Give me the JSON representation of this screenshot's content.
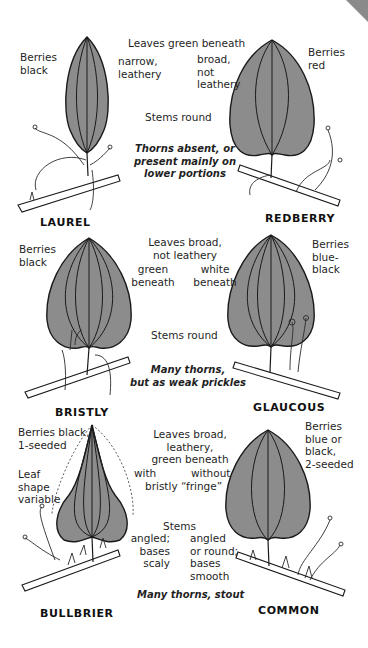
{
  "page": {
    "colors": {
      "leaf_fill": "#8c8c8c",
      "line": "#1a1a1a",
      "background": "#ffffff",
      "corner_tab": "#8a8a8a"
    }
  },
  "rows": [
    {
      "left": {
        "species": "LAUREL",
        "berries": "Berries\nblack"
      },
      "right": {
        "species": "REDBERRY",
        "berries": "Berries\nred"
      },
      "center": {
        "leaves_heading": "Leaves green beneath",
        "leaves_left": "narrow,\nleathery",
        "leaves_right": "broad,\nnot\nleathery",
        "stems": "Stems round",
        "thorns": "Thorns absent, or\npresent mainly on\nlower portions"
      }
    },
    {
      "left": {
        "species": "BRISTLY",
        "berries": "Berries\nblack"
      },
      "right": {
        "species": "GLAUCOUS",
        "berries": "Berries\nblue-\nblack"
      },
      "center": {
        "leaves_heading": "Leaves broad,\nnot leathery",
        "leaves_left": "green\nbeneath",
        "leaves_right": "white\nbeneath",
        "stems": "Stems round",
        "thorns": "Many thorns,\nbut as weak prickles"
      }
    },
    {
      "left": {
        "species": "BULLBRIER",
        "berries": "Berries black,\n1-seeded",
        "note": "Leaf\nshape\nvariable"
      },
      "right": {
        "species": "COMMON",
        "berries": "Berries\nblue or\nblack,\n2-seeded"
      },
      "center": {
        "leaves_heading": "Leaves broad,\nleathery,\ngreen beneath",
        "leaves_left": "with",
        "leaves_right": "without",
        "leaves_footer": "bristly “fringe”",
        "stems": "Stems",
        "stems_left": "angled;\nbases\nscaly",
        "stems_right": "angled\nor round;\nbases\nsmooth",
        "thorns": "Many thorns, stout"
      }
    }
  ]
}
